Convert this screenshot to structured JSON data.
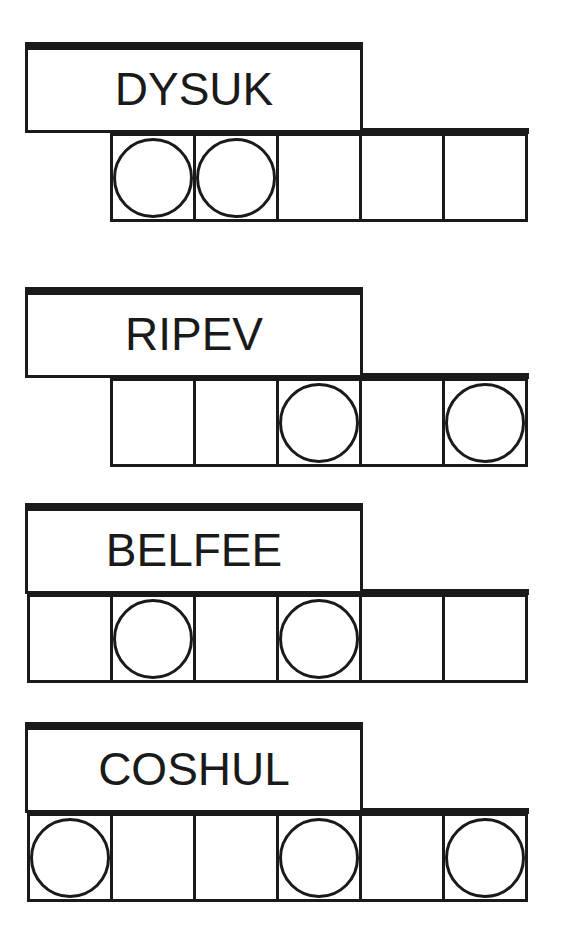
{
  "puzzles": [
    {
      "scrambled": "DYSUK",
      "letter_count": 5,
      "circled_positions": [
        1,
        2
      ],
      "answer": ""
    },
    {
      "scrambled": "RIPEV",
      "letter_count": 5,
      "circled_positions": [
        3,
        5
      ],
      "answer": ""
    },
    {
      "scrambled": "BELFEE",
      "letter_count": 6,
      "circled_positions": [
        2,
        4
      ],
      "answer": ""
    },
    {
      "scrambled": "COSHUL",
      "letter_count": 6,
      "circled_positions": [
        1,
        4,
        6
      ],
      "answer": ""
    }
  ],
  "colors": {
    "ink": "#1a1a1a",
    "background": "#ffffff"
  }
}
